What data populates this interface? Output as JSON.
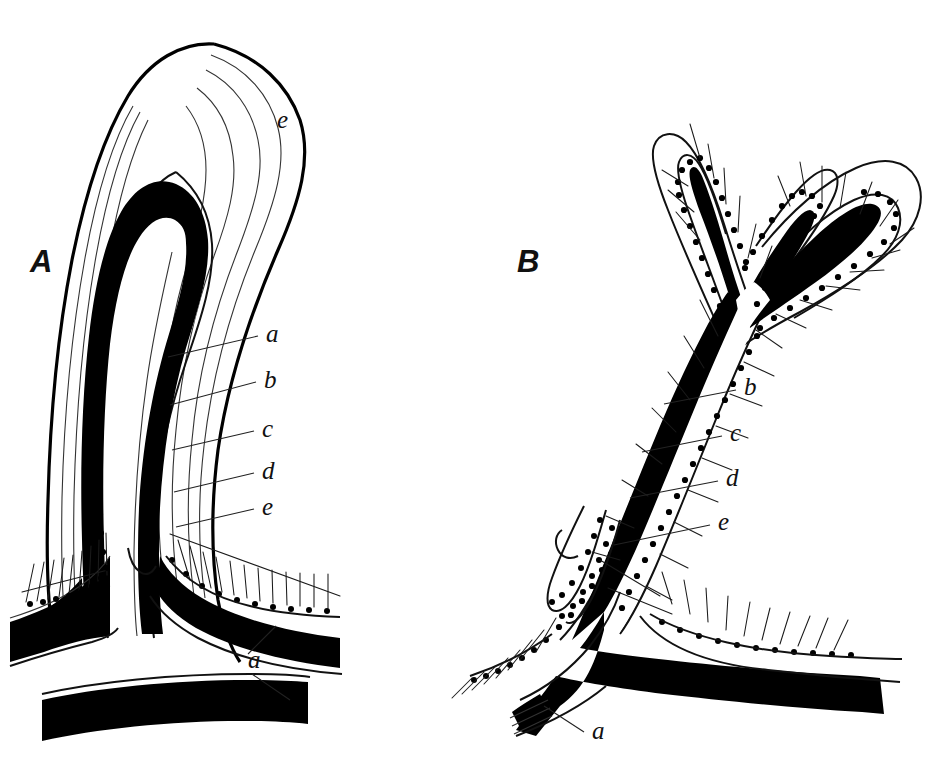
{
  "figure": {
    "background_color": "#ffffff",
    "ink_color": "#000000",
    "width": 937,
    "height": 769,
    "style": "engraved line drawing, black ink on white"
  },
  "panels": [
    {
      "id": "A",
      "letter": "A",
      "letter_x": 30,
      "letter_y": 272,
      "description": "unbranched curved horn-shaped longitudinal section"
    },
    {
      "id": "B",
      "letter": "B",
      "letter_x": 517,
      "letter_y": 272,
      "description": "branched forked longitudinal section with trichomes"
    }
  ],
  "labels": {
    "panel_a": [
      {
        "text": "e",
        "x": 277,
        "y": 128,
        "leader": false
      },
      {
        "text": "a",
        "x": 266,
        "y": 342,
        "leader": true
      },
      {
        "text": "b",
        "x": 264,
        "y": 388,
        "leader": true
      },
      {
        "text": "c",
        "x": 262,
        "y": 437,
        "leader": true
      },
      {
        "text": "d",
        "x": 262,
        "y": 479,
        "leader": true
      },
      {
        "text": "e",
        "x": 262,
        "y": 515,
        "leader": true
      },
      {
        "text": "a",
        "x": 248,
        "y": 668,
        "leader": true
      }
    ],
    "panel_b": [
      {
        "text": "b",
        "x": 744,
        "y": 395,
        "leader": true
      },
      {
        "text": "c",
        "x": 730,
        "y": 441,
        "leader": true
      },
      {
        "text": "d",
        "x": 726,
        "y": 486,
        "leader": true
      },
      {
        "text": "e",
        "x": 718,
        "y": 530,
        "leader": true
      },
      {
        "text": "a",
        "x": 592,
        "y": 739,
        "leader": true
      }
    ]
  },
  "legend_keys": [
    {
      "key": "a",
      "meaning": "innermost solid black core layer"
    },
    {
      "key": "b",
      "meaning": "dotted cell row layer"
    },
    {
      "key": "c",
      "meaning": "inner sheath line"
    },
    {
      "key": "d",
      "meaning": "middle sheath line"
    },
    {
      "key": "e",
      "meaning": "outer sheath / enveloping layer"
    }
  ]
}
